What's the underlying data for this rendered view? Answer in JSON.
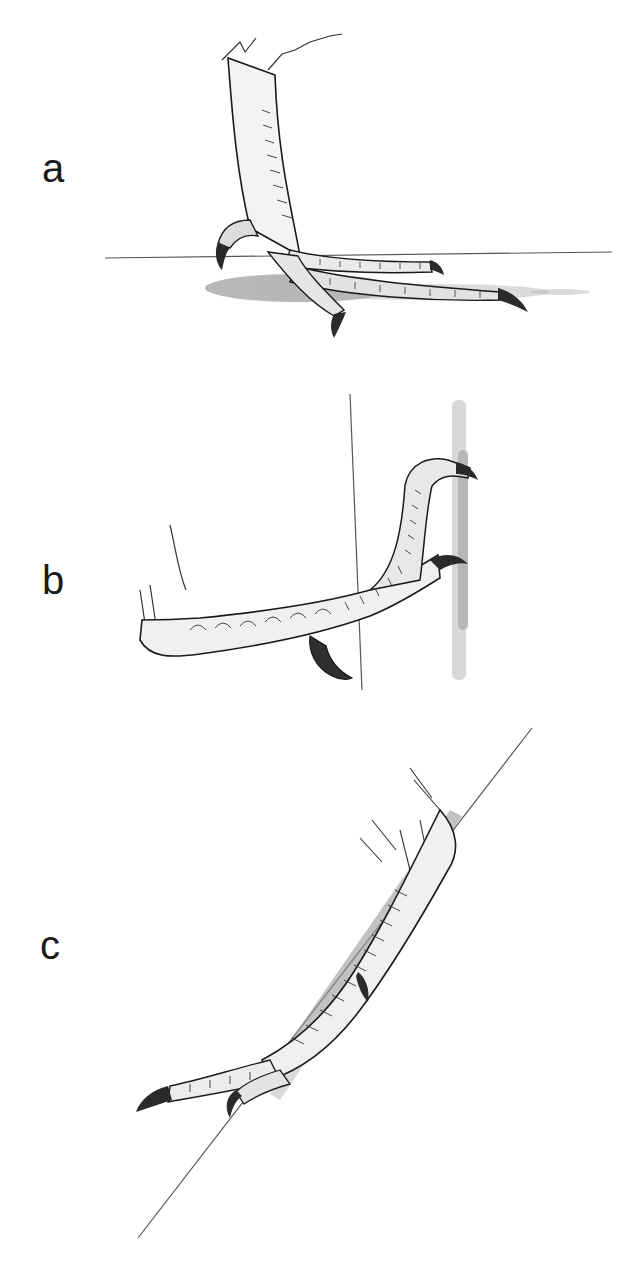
{
  "figure": {
    "panels": [
      {
        "label": "a",
        "subject": "bird foot perched on horizontal surface"
      },
      {
        "label": "b",
        "subject": "bird foot gripping vertical surface"
      },
      {
        "label": "c",
        "subject": "bird foot resting on inclined surface"
      }
    ],
    "colors": {
      "ink": "#1a1a1a",
      "line": "#555555",
      "stipple": "#9a9a9a",
      "background": "#ffffff"
    }
  }
}
